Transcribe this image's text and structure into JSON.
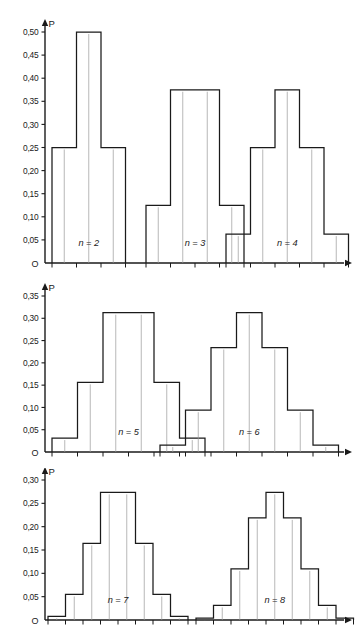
{
  "figure": {
    "title": "",
    "axis_label_y": "P",
    "origin_label": "O",
    "decimal_separator": ",",
    "line_color": "#1a1a1a",
    "background_color": "#ffffff"
  },
  "panels": [
    {
      "id": "panel-top",
      "y_label": "P",
      "y_ticks": [
        "0,50",
        "0,45",
        "0,40",
        "0,35",
        "0,30",
        "0,25",
        "0,20",
        "0,15",
        "0,10",
        "0,05"
      ],
      "y_tick_values": [
        0.5,
        0.45,
        0.4,
        0.35,
        0.3,
        0.25,
        0.2,
        0.15,
        0.1,
        0.05
      ],
      "origin_label": "O",
      "groups": [
        {
          "label": "n = 2",
          "n": 2,
          "k": [
            0,
            1,
            2
          ],
          "values": [
            0.25,
            0.5,
            0.25
          ]
        },
        {
          "label": "n = 3",
          "n": 3,
          "k": [
            0,
            1,
            2,
            3
          ],
          "values": [
            0.125,
            0.375,
            0.375,
            0.125
          ]
        },
        {
          "label": "n = 4",
          "n": 4,
          "k": [
            0,
            1,
            2,
            3,
            4
          ],
          "values": [
            0.0625,
            0.25,
            0.375,
            0.25,
            0.0625
          ]
        }
      ]
    },
    {
      "id": "panel-middle",
      "y_label": "P",
      "y_ticks": [
        "0,35",
        "0,30",
        "0,25",
        "0,20",
        "0,15",
        "0,10",
        "0,05"
      ],
      "y_tick_values": [
        0.35,
        0.3,
        0.25,
        0.2,
        0.15,
        0.1,
        0.05
      ],
      "origin_label": "O",
      "groups": [
        {
          "label": "n = 5",
          "n": 5,
          "k": [
            0,
            1,
            2,
            3,
            4,
            5
          ],
          "values": [
            0.03125,
            0.15625,
            0.3125,
            0.3125,
            0.15625,
            0.03125
          ]
        },
        {
          "label": "n = 6",
          "n": 6,
          "k": [
            0,
            1,
            2,
            3,
            4,
            5,
            6
          ],
          "values": [
            0.015625,
            0.09375,
            0.234375,
            0.3125,
            0.234375,
            0.09375,
            0.015625
          ]
        }
      ]
    },
    {
      "id": "panel-bottom",
      "y_label": "P",
      "y_ticks": [
        "0,30",
        "0,25",
        "0,20",
        "0,15",
        "0,10",
        "0,05"
      ],
      "y_tick_values": [
        0.3,
        0.25,
        0.2,
        0.15,
        0.1,
        0.05
      ],
      "origin_label": "O",
      "groups": [
        {
          "label": "n = 7",
          "n": 7,
          "k": [
            0,
            1,
            2,
            3,
            4,
            5,
            6,
            7
          ],
          "values": [
            0.0078125,
            0.0546875,
            0.1640625,
            0.2734375,
            0.2734375,
            0.1640625,
            0.0546875,
            0.0078125
          ]
        },
        {
          "label": "n = 8",
          "n": 8,
          "k": [
            0,
            1,
            2,
            3,
            4,
            5,
            6,
            7,
            8
          ],
          "values": [
            0.00390625,
            0.03125,
            0.109375,
            0.21875,
            0.2734375,
            0.21875,
            0.109375,
            0.03125,
            0.00390625
          ]
        }
      ]
    }
  ],
  "chart_data": {
    "type": "bar",
    "xlabel": "",
    "ylabel": "P",
    "grid": false,
    "legend": "none",
    "panels": [
      {
        "name": "panel-top",
        "ylim": [
          0,
          0.52
        ],
        "yticks": [
          0.05,
          0.1,
          0.15,
          0.2,
          0.25,
          0.3,
          0.35,
          0.4,
          0.45,
          0.5
        ],
        "ytick_labels": [
          "0,05",
          "0,10",
          "0,15",
          "0,20",
          "0,25",
          "0,30",
          "0,35",
          "0,40",
          "0,45",
          "0,50"
        ],
        "series": [
          {
            "name": "n = 2",
            "categories": [
              0,
              1,
              2
            ],
            "values": [
              0.25,
              0.5,
              0.25
            ]
          },
          {
            "name": "n = 3",
            "categories": [
              0,
              1,
              2,
              3
            ],
            "values": [
              0.125,
              0.375,
              0.375,
              0.125
            ]
          },
          {
            "name": "n = 4",
            "categories": [
              0,
              1,
              2,
              3,
              4
            ],
            "values": [
              0.0625,
              0.25,
              0.375,
              0.25,
              0.0625
            ]
          }
        ]
      },
      {
        "name": "panel-middle",
        "ylim": [
          0,
          0.36
        ],
        "yticks": [
          0.05,
          0.1,
          0.15,
          0.2,
          0.25,
          0.3,
          0.35
        ],
        "ytick_labels": [
          "0,05",
          "0,10",
          "0,15",
          "0,20",
          "0,25",
          "0,30",
          "0,35"
        ],
        "series": [
          {
            "name": "n = 5",
            "categories": [
              0,
              1,
              2,
              3,
              4,
              5
            ],
            "values": [
              0.03125,
              0.15625,
              0.3125,
              0.3125,
              0.15625,
              0.03125
            ]
          },
          {
            "name": "n = 6",
            "categories": [
              0,
              1,
              2,
              3,
              4,
              5,
              6
            ],
            "values": [
              0.015625,
              0.09375,
              0.234375,
              0.3125,
              0.234375,
              0.09375,
              0.015625
            ]
          }
        ]
      },
      {
        "name": "panel-bottom",
        "ylim": [
          0,
          0.31
        ],
        "yticks": [
          0.05,
          0.1,
          0.15,
          0.2,
          0.25,
          0.3
        ],
        "ytick_labels": [
          "0,05",
          "0,10",
          "0,15",
          "0,20",
          "0,25",
          "0,30"
        ],
        "series": [
          {
            "name": "n = 7",
            "categories": [
              0,
              1,
              2,
              3,
              4,
              5,
              6,
              7
            ],
            "values": [
              0.0078125,
              0.0546875,
              0.1640625,
              0.2734375,
              0.2734375,
              0.1640625,
              0.0546875,
              0.0078125
            ]
          },
          {
            "name": "n = 8",
            "categories": [
              0,
              1,
              2,
              3,
              4,
              5,
              6,
              7,
              8
            ],
            "values": [
              0.00390625,
              0.03125,
              0.109375,
              0.21875,
              0.2734375,
              0.21875,
              0.109375,
              0.03125,
              0.00390625
            ]
          }
        ]
      }
    ]
  }
}
